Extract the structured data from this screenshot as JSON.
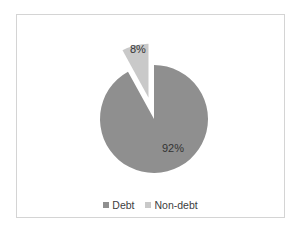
{
  "chart_data": {
    "type": "pie",
    "title": "",
    "categories": [
      "Debt",
      "Non-debt"
    ],
    "values": [
      92,
      8
    ],
    "labels": [
      "92%",
      "8%"
    ],
    "colors": [
      "#8f8f8f",
      "#c9c9c9"
    ],
    "exploded": [
      "Non-debt"
    ],
    "legend_position": "bottom"
  },
  "legend": [
    {
      "label": "Debt",
      "color": "#8f8f8f"
    },
    {
      "label": "Non-debt",
      "color": "#c9c9c9"
    }
  ]
}
